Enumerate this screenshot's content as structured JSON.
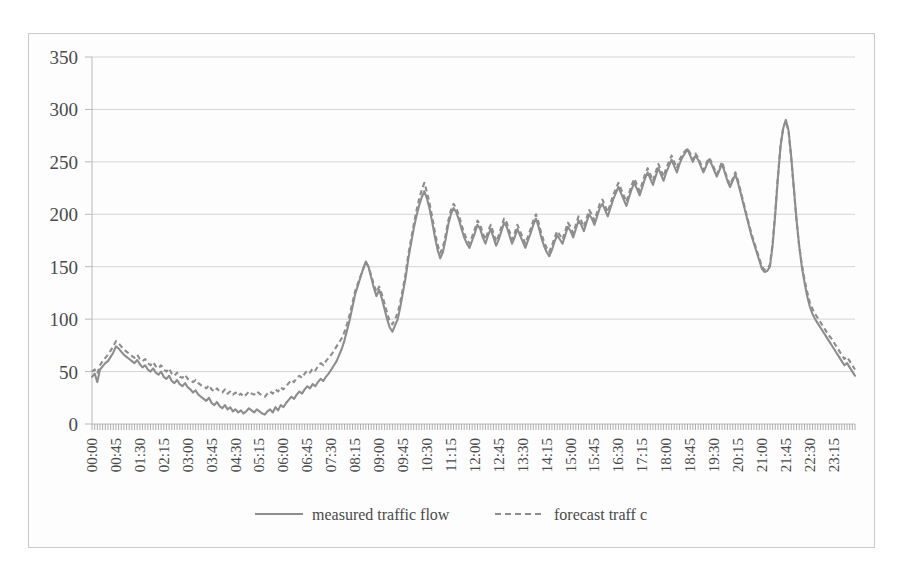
{
  "figure": {
    "background_color": "#ffffff",
    "frame_color": "#c9c9c9",
    "line_color": "#8d8d8d"
  },
  "legend": {
    "position": "bottom-center",
    "measured_label": "measured traffic flow",
    "forecast_label": "forecast traff c"
  },
  "axes": {
    "y_ticks": [
      "0",
      "50",
      "100",
      "150",
      "200",
      "250",
      "300",
      "350"
    ],
    "x_ticks": [
      "00:00",
      "00:45",
      "01:30",
      "02:15",
      "03:00",
      "03:45",
      "04:30",
      "05:15",
      "06:00",
      "06:45",
      "07:30",
      "08:15",
      "09:00",
      "09:45",
      "10:30",
      "11:15",
      "12:00",
      "12:45",
      "13:30",
      "14:15",
      "15:00",
      "15:45",
      "16:30",
      "17:15",
      "18:00",
      "18:45",
      "19:30",
      "20:15",
      "21:00",
      "21:45",
      "22:30",
      "23:15"
    ]
  },
  "chart_data": {
    "type": "line",
    "title": "",
    "xlabel": "",
    "ylabel": "",
    "ylim": [
      0,
      350
    ],
    "ytick_step": 50,
    "grid": true,
    "legend_position": "bottom-center",
    "x_tick_interval_minutes": 45,
    "sample_interval_minutes": 5,
    "x": [
      "00:00",
      "00:05",
      "00:10",
      "00:15",
      "00:20",
      "00:25",
      "00:30",
      "00:35",
      "00:40",
      "00:45",
      "00:50",
      "00:55",
      "01:00",
      "01:05",
      "01:10",
      "01:15",
      "01:20",
      "01:25",
      "01:30",
      "01:35",
      "01:40",
      "01:45",
      "01:50",
      "01:55",
      "02:00",
      "02:05",
      "02:10",
      "02:15",
      "02:20",
      "02:25",
      "02:30",
      "02:35",
      "02:40",
      "02:45",
      "02:50",
      "02:55",
      "03:00",
      "03:05",
      "03:10",
      "03:15",
      "03:20",
      "03:25",
      "03:30",
      "03:35",
      "03:40",
      "03:45",
      "03:50",
      "03:55",
      "04:00",
      "04:05",
      "04:10",
      "04:15",
      "04:20",
      "04:25",
      "04:30",
      "04:35",
      "04:40",
      "04:45",
      "04:50",
      "04:55",
      "05:00",
      "05:05",
      "05:10",
      "05:15",
      "05:20",
      "05:25",
      "05:30",
      "05:35",
      "05:40",
      "05:45",
      "05:50",
      "05:55",
      "06:00",
      "06:05",
      "06:10",
      "06:15",
      "06:20",
      "06:25",
      "06:30",
      "06:35",
      "06:40",
      "06:45",
      "06:50",
      "06:55",
      "07:00",
      "07:05",
      "07:10",
      "07:15",
      "07:20",
      "07:25",
      "07:30",
      "07:35",
      "07:40",
      "07:45",
      "07:50",
      "07:55",
      "08:00",
      "08:05",
      "08:10",
      "08:15",
      "08:20",
      "08:25",
      "08:30",
      "08:35",
      "08:40",
      "08:45",
      "08:50",
      "08:55",
      "09:00",
      "09:05",
      "09:10",
      "09:15",
      "09:20",
      "09:25",
      "09:30",
      "09:35",
      "09:40",
      "09:45",
      "09:50",
      "09:55",
      "10:00",
      "10:05",
      "10:10",
      "10:15",
      "10:20",
      "10:25",
      "10:30",
      "10:35",
      "10:40",
      "10:45",
      "10:50",
      "10:55",
      "11:00",
      "11:05",
      "11:10",
      "11:15",
      "11:20",
      "11:25",
      "11:30",
      "11:35",
      "11:40",
      "11:45",
      "11:50",
      "11:55",
      "12:00",
      "12:05",
      "12:10",
      "12:15",
      "12:20",
      "12:25",
      "12:30",
      "12:35",
      "12:40",
      "12:45",
      "12:50",
      "12:55",
      "13:00",
      "13:05",
      "13:10",
      "13:15",
      "13:20",
      "13:25",
      "13:30",
      "13:35",
      "13:40",
      "13:45",
      "13:50",
      "13:55",
      "14:00",
      "14:05",
      "14:10",
      "14:15",
      "14:20",
      "14:25",
      "14:30",
      "14:35",
      "14:40",
      "14:45",
      "14:50",
      "14:55",
      "15:00",
      "15:05",
      "15:10",
      "15:15",
      "15:20",
      "15:25",
      "15:30",
      "15:35",
      "15:40",
      "15:45",
      "15:50",
      "15:55",
      "16:00",
      "16:05",
      "16:10",
      "16:15",
      "16:20",
      "16:25",
      "16:30",
      "16:35",
      "16:40",
      "16:45",
      "16:50",
      "16:55",
      "17:00",
      "17:05",
      "17:10",
      "17:15",
      "17:20",
      "17:25",
      "17:30",
      "17:35",
      "17:40",
      "17:45",
      "17:50",
      "17:55",
      "18:00",
      "18:05",
      "18:10",
      "18:15",
      "18:20",
      "18:25",
      "18:30",
      "18:35",
      "18:40",
      "18:45",
      "18:50",
      "18:55",
      "19:00",
      "19:05",
      "19:10",
      "19:15",
      "19:20",
      "19:25",
      "19:30",
      "19:35",
      "19:40",
      "19:45",
      "19:50",
      "19:55",
      "20:00",
      "20:05",
      "20:10",
      "20:15",
      "20:20",
      "20:25",
      "20:30",
      "20:35",
      "20:40",
      "20:45",
      "20:50",
      "20:55",
      "21:00",
      "21:05",
      "21:10",
      "21:15",
      "21:20",
      "21:25",
      "21:30",
      "21:35",
      "21:40",
      "21:45",
      "21:50",
      "21:55",
      "22:00",
      "22:05",
      "22:10",
      "22:15",
      "22:20",
      "22:25",
      "22:30",
      "22:35",
      "22:40",
      "22:45",
      "22:50",
      "22:55",
      "23:00",
      "23:05",
      "23:10",
      "23:15",
      "23:20",
      "23:25",
      "23:30",
      "23:35",
      "23:40",
      "23:45",
      "23:50",
      "23:55"
    ],
    "series": [
      {
        "name": "measured traffic flow",
        "style": "solid",
        "color": "#8d8d8d",
        "values": [
          45,
          48,
          40,
          52,
          55,
          58,
          60,
          64,
          68,
          74,
          72,
          69,
          66,
          64,
          62,
          60,
          58,
          61,
          57,
          54,
          56,
          52,
          50,
          53,
          49,
          47,
          50,
          45,
          43,
          46,
          41,
          39,
          42,
          38,
          36,
          39,
          35,
          33,
          30,
          32,
          28,
          26,
          24,
          22,
          25,
          20,
          18,
          21,
          17,
          15,
          18,
          14,
          16,
          12,
          14,
          11,
          13,
          10,
          12,
          15,
          13,
          11,
          14,
          12,
          10,
          9,
          12,
          14,
          11,
          16,
          13,
          18,
          16,
          20,
          23,
          26,
          24,
          28,
          31,
          29,
          33,
          36,
          34,
          38,
          36,
          40,
          43,
          41,
          45,
          48,
          52,
          56,
          60,
          66,
          72,
          80,
          90,
          100,
          112,
          124,
          132,
          140,
          148,
          155,
          150,
          140,
          130,
          122,
          128,
          120,
          110,
          100,
          92,
          88,
          94,
          100,
          112,
          126,
          140,
          158,
          172,
          186,
          198,
          208,
          216,
          222,
          215,
          205,
          192,
          178,
          166,
          158,
          164,
          176,
          190,
          200,
          206,
          202,
          195,
          186,
          178,
          172,
          168,
          175,
          182,
          190,
          186,
          178,
          172,
          180,
          186,
          178,
          170,
          176,
          184,
          192,
          188,
          180,
          172,
          178,
          186,
          180,
          174,
          168,
          175,
          182,
          190,
          196,
          188,
          178,
          170,
          164,
          160,
          166,
          174,
          180,
          176,
          172,
          180,
          188,
          184,
          178,
          186,
          194,
          190,
          184,
          192,
          200,
          196,
          190,
          198,
          206,
          210,
          204,
          198,
          206,
          214,
          220,
          226,
          220,
          214,
          208,
          216,
          224,
          230,
          224,
          218,
          226,
          234,
          240,
          234,
          228,
          236,
          244,
          238,
          232,
          240,
          246,
          252,
          246,
          240,
          248,
          254,
          258,
          262,
          256,
          250,
          256,
          252,
          246,
          240,
          246,
          252,
          248,
          242,
          236,
          242,
          248,
          240,
          232,
          226,
          232,
          238,
          230,
          220,
          210,
          200,
          190,
          180,
          172,
          164,
          156,
          148,
          145,
          146,
          150,
          170,
          200,
          235,
          265,
          282,
          290,
          280,
          255,
          225,
          195,
          170,
          150,
          135,
          122,
          112,
          105,
          100,
          96,
          92,
          88,
          84,
          80,
          76,
          72,
          68,
          64,
          60,
          56,
          58,
          54,
          50,
          46
        ]
      },
      {
        "name": "forecast traff c",
        "style": "dashed",
        "color": "#8d8d8d",
        "values": [
          50,
          52,
          48,
          56,
          60,
          63,
          66,
          70,
          74,
          79,
          77,
          74,
          71,
          69,
          67,
          65,
          63,
          66,
          62,
          60,
          62,
          58,
          56,
          59,
          55,
          53,
          56,
          52,
          50,
          53,
          48,
          46,
          49,
          45,
          44,
          47,
          43,
          42,
          40,
          42,
          39,
          37,
          36,
          34,
          37,
          33,
          31,
          34,
          31,
          30,
          33,
          29,
          31,
          28,
          30,
          27,
          29,
          26,
          28,
          31,
          29,
          28,
          31,
          29,
          27,
          26,
          29,
          31,
          29,
          33,
          31,
          35,
          33,
          36,
          39,
          42,
          40,
          44,
          46,
          44,
          48,
          51,
          49,
          53,
          51,
          55,
          58,
          56,
          60,
          63,
          66,
          70,
          74,
          78,
          82,
          88,
          96,
          105,
          116,
          127,
          134,
          141,
          148,
          154,
          150,
          142,
          133,
          126,
          131,
          124,
          115,
          106,
          98,
          95,
          100,
          106,
          117,
          130,
          144,
          162,
          176,
          190,
          203,
          214,
          223,
          230,
          221,
          210,
          197,
          183,
          171,
          163,
          169,
          180,
          194,
          204,
          210,
          206,
          199,
          190,
          182,
          176,
          172,
          179,
          186,
          194,
          190,
          182,
          176,
          184,
          190,
          182,
          174,
          180,
          188,
          196,
          192,
          184,
          176,
          182,
          190,
          184,
          178,
          172,
          179,
          186,
          194,
          200,
          192,
          182,
          174,
          168,
          164,
          170,
          178,
          184,
          180,
          176,
          184,
          192,
          188,
          182,
          190,
          198,
          194,
          188,
          196,
          204,
          200,
          194,
          202,
          210,
          214,
          208,
          202,
          210,
          218,
          224,
          230,
          224,
          218,
          212,
          220,
          228,
          234,
          228,
          222,
          230,
          238,
          244,
          238,
          232,
          240,
          248,
          242,
          236,
          244,
          250,
          256,
          250,
          244,
          252,
          257,
          260,
          263,
          258,
          252,
          258,
          254,
          248,
          242,
          248,
          254,
          250,
          244,
          238,
          244,
          250,
          242,
          234,
          228,
          234,
          240,
          232,
          222,
          212,
          202,
          192,
          182,
          174,
          166,
          158,
          150,
          147,
          148,
          152,
          172,
          202,
          236,
          266,
          283,
          289,
          279,
          254,
          224,
          194,
          170,
          152,
          138,
          126,
          116,
          110,
          105,
          101,
          97,
          93,
          89,
          85,
          82,
          78,
          74,
          70,
          66,
          62,
          64,
          60,
          56,
          52
        ]
      }
    ]
  }
}
